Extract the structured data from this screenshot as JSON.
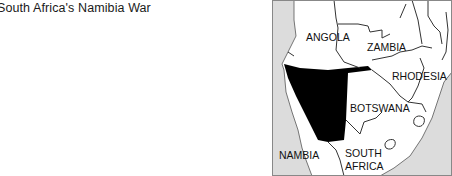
{
  "title": "South Africa's Namibia War",
  "map": {
    "labels": {
      "angola": "ANGOLA",
      "zambia": "ZAMBIA",
      "rhodesia": "RHODESIA",
      "botswana": "BOTSWANA",
      "namibia": "NAMBIA",
      "south_africa_1": "SOUTH",
      "south_africa_2": "AFRICA"
    },
    "colors": {
      "ocean": "#dcdcdc",
      "land": "#ffffff",
      "highlight": "#000000",
      "border": "#333333"
    }
  }
}
